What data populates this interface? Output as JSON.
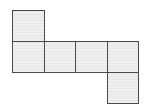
{
  "diagram": {
    "type": "cube-net",
    "colors": {
      "fill": "#ececec",
      "stroke": "#4a4a4a",
      "background": "#ffffff"
    },
    "faces": [
      {
        "id": "face-1",
        "col": 0,
        "row": 0
      },
      {
        "id": "face-2",
        "col": 0,
        "row": 1
      },
      {
        "id": "face-3",
        "col": 1,
        "row": 1
      },
      {
        "id": "face-4",
        "col": 2,
        "row": 1
      },
      {
        "id": "face-5",
        "col": 3,
        "row": 1
      },
      {
        "id": "face-6",
        "col": 3,
        "row": 2
      }
    ]
  }
}
